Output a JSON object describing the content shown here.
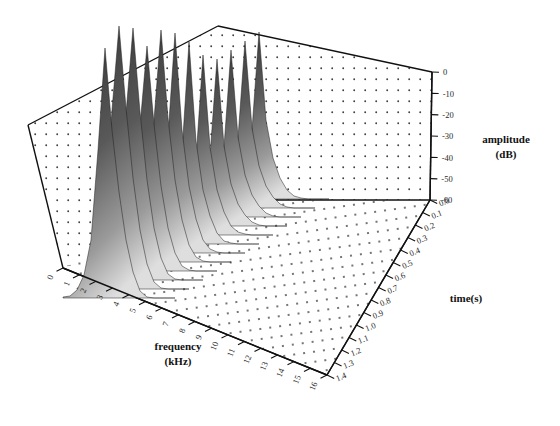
{
  "figure": {
    "kind": "3d-waterfall-spectrogram",
    "background_color": "#ffffff",
    "line_color": "#111111",
    "ridge_dark_color": "#3b3b3b",
    "ridge_light_color": "#d8d8d8",
    "grid_dot_color": "#444444"
  },
  "axes": {
    "frequency": {
      "label_line1": "frequency",
      "label_line2": "(kHz)",
      "units": "kHz",
      "min": 0,
      "max": 16,
      "step": 1,
      "ticks": [
        "0",
        "1",
        "2",
        "3",
        "4",
        "5",
        "6",
        "7",
        "8",
        "9",
        "10",
        "11",
        "12",
        "13",
        "14",
        "15",
        "16"
      ]
    },
    "time": {
      "label": "time(s)",
      "units": "s",
      "min": 0.0,
      "max": 1.4,
      "step": 0.1,
      "ticks": [
        "0.0",
        "0.1",
        "0.2",
        "0.3",
        "0.4",
        "0.5",
        "0.6",
        "0.7",
        "0.8",
        "0.9",
        "1.0",
        "1.1",
        "1.2",
        "1.3",
        "1.4"
      ]
    },
    "amplitude": {
      "label_line1": "amplitude",
      "label_line2": "(dB)",
      "units": "dB",
      "min": -60,
      "max": 0,
      "step": 10,
      "ticks": [
        "0",
        "-10",
        "-20",
        "-30",
        "-40",
        "-50",
        "-60"
      ]
    }
  },
  "chart_data": {
    "type": "line",
    "title": "",
    "xlabel": "frequency (kHz)",
    "ylabel": "time(s)",
    "zlabel": "amplitude (dB)",
    "xlim": [
      0,
      16
    ],
    "ylim": [
      0.0,
      1.4
    ],
    "zlim": [
      -60,
      0
    ],
    "grid": true,
    "legend": "none",
    "projection": "3d-waterfall",
    "x": [
      0,
      1,
      2,
      3,
      4,
      5,
      6,
      7,
      8,
      9,
      10,
      11,
      12,
      13,
      14,
      15,
      16
    ],
    "series": [
      {
        "name": "t=0.0",
        "time": 0.0,
        "values": [
          -60,
          -58,
          -55,
          -50,
          -42,
          -30,
          -14,
          -2,
          -18,
          -34,
          -44,
          -52,
          -57,
          -59,
          -60,
          -60,
          -60
        ]
      },
      {
        "name": "t=0.1",
        "time": 0.1,
        "values": [
          -60,
          -57,
          -53,
          -47,
          -38,
          -26,
          -10,
          -1,
          -15,
          -32,
          -43,
          -51,
          -56,
          -59,
          -60,
          -60,
          -60
        ]
      },
      {
        "name": "t=0.2",
        "time": 0.2,
        "values": [
          -60,
          -58,
          -54,
          -49,
          -40,
          -28,
          -12,
          -3,
          -17,
          -33,
          -44,
          -52,
          -57,
          -59,
          -60,
          -60,
          -60
        ]
      },
      {
        "name": "t=0.3",
        "time": 0.3,
        "values": [
          -60,
          -59,
          -56,
          -52,
          -45,
          -34,
          -20,
          -8,
          -24,
          -38,
          -47,
          -54,
          -58,
          -60,
          -60,
          -60,
          -60
        ]
      },
      {
        "name": "t=0.4",
        "time": 0.4,
        "values": [
          -60,
          -57,
          -53,
          -48,
          -39,
          -27,
          -11,
          -2,
          -16,
          -32,
          -43,
          -51,
          -56,
          -59,
          -60,
          -60,
          -60
        ]
      },
      {
        "name": "t=0.5",
        "time": 0.5,
        "values": [
          -60,
          -58,
          -55,
          -50,
          -42,
          -30,
          -15,
          -4,
          -20,
          -35,
          -45,
          -53,
          -57,
          -59,
          -60,
          -60,
          -60
        ]
      },
      {
        "name": "t=0.6",
        "time": 0.6,
        "values": [
          -60,
          -59,
          -57,
          -53,
          -47,
          -37,
          -24,
          -11,
          -27,
          -40,
          -49,
          -55,
          -58,
          -60,
          -60,
          -60,
          -60
        ]
      },
      {
        "name": "t=0.7",
        "time": 0.7,
        "values": [
          -60,
          -58,
          -54,
          -49,
          -41,
          -29,
          -13,
          -3,
          -18,
          -34,
          -44,
          -52,
          -57,
          -59,
          -60,
          -60,
          -60
        ]
      },
      {
        "name": "t=0.8",
        "time": 0.8,
        "values": [
          -60,
          -59,
          -56,
          -52,
          -45,
          -35,
          -21,
          -9,
          -25,
          -39,
          -48,
          -54,
          -58,
          -60,
          -60,
          -60,
          -60
        ]
      },
      {
        "name": "t=0.9",
        "time": 0.9,
        "values": [
          -60,
          -59,
          -58,
          -55,
          -50,
          -42,
          -31,
          -20,
          -34,
          -45,
          -52,
          -57,
          -59,
          -60,
          -60,
          -60,
          -60
        ]
      },
      {
        "name": "t=1.0",
        "time": 1.0,
        "values": [
          -60,
          -60,
          -59,
          -57,
          -53,
          -46,
          -36,
          -25,
          -38,
          -48,
          -54,
          -58,
          -60,
          -60,
          -60,
          -60,
          -60
        ]
      },
      {
        "name": "t=1.1",
        "time": 1.1,
        "values": [
          -60,
          -60,
          -59,
          -58,
          -55,
          -49,
          -40,
          -30,
          -42,
          -51,
          -56,
          -59,
          -60,
          -60,
          -60,
          -60,
          -60
        ]
      },
      {
        "name": "t=1.2",
        "time": 1.2,
        "values": [
          -60,
          -60,
          -60,
          -59,
          -57,
          -53,
          -46,
          -38,
          -48,
          -55,
          -58,
          -60,
          -60,
          -60,
          -60,
          -60,
          -60
        ]
      },
      {
        "name": "t=1.3",
        "time": 1.3,
        "values": [
          -60,
          -60,
          -60,
          -59,
          -58,
          -55,
          -50,
          -43,
          -52,
          -57,
          -59,
          -60,
          -60,
          -60,
          -60,
          -60,
          -60
        ]
      },
      {
        "name": "t=1.4",
        "time": 1.4,
        "values": [
          -60,
          -60,
          -60,
          -60,
          -59,
          -57,
          -53,
          -47,
          -55,
          -58,
          -60,
          -60,
          -60,
          -60,
          -60,
          -60,
          -60
        ]
      }
    ]
  },
  "geometry": {
    "origin": [
      63,
      268
    ],
    "freq_far": [
      327,
      375
    ],
    "time_far": [
      430,
      200
    ],
    "back_apex": [
      218,
      26
    ],
    "left_top": [
      28,
      125
    ],
    "amp_top": [
      432,
      72
    ]
  }
}
